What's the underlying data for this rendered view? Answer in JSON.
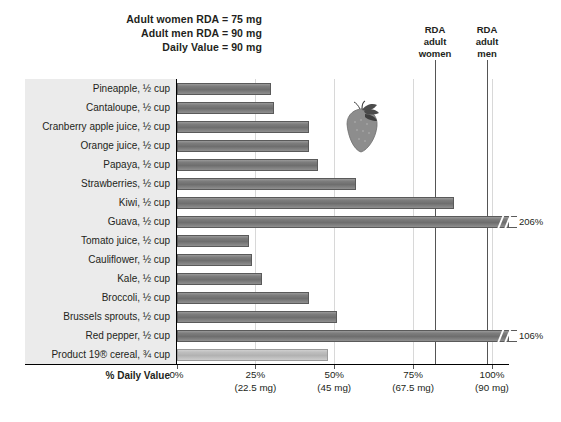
{
  "header": {
    "notes": [
      "Adult women RDA = 75 mg",
      "Adult men RDA = 90 mg",
      "Daily Value = 90 mg"
    ]
  },
  "annotations": {
    "women": [
      "RDA",
      "adult",
      "women"
    ],
    "men": [
      "RDA",
      "adult",
      "men"
    ]
  },
  "axis": {
    "title": "% Daily Value",
    "ticks": [
      {
        "pct": "0%",
        "mg": ""
      },
      {
        "pct": "25%",
        "mg": "(22.5 mg)"
      },
      {
        "pct": "50%",
        "mg": "(45 mg)"
      },
      {
        "pct": "75%",
        "mg": "(67.5 mg)"
      },
      {
        "pct": "100%",
        "mg": "(90 mg)"
      }
    ]
  },
  "illustration": {
    "name": "strawberry-illustration"
  },
  "chart_data": {
    "type": "bar",
    "xlabel": "% Daily Value",
    "ylabel": "",
    "xlim": [
      0,
      110
    ],
    "grid": true,
    "orientation": "horizontal",
    "legend": "none",
    "reference_lines": [
      {
        "label": "RDA adult women",
        "value": 83.3,
        "note": "75 mg"
      },
      {
        "label": "RDA adult men",
        "value": 100,
        "note": "90 mg"
      }
    ],
    "categories": [
      "Pineapple, ½ cup",
      "Cantaloupe, ½ cup",
      "Cranberry apple juice, ½ cup",
      "Orange juice, ½ cup",
      "Papaya, ½ cup",
      "Strawberries, ½ cup",
      "Kiwi, ½ cup",
      "Guava, ½ cup",
      "Tomato juice, ½ cup",
      "Cauliflower, ½ cup",
      "Kale, ½ cup",
      "Broccoli, ½ cup",
      "Brussels sprouts, ½ cup",
      "Red pepper, ½ cup",
      "Product 19® cereal, ¾ cup"
    ],
    "values": [
      30,
      31,
      42,
      42,
      45,
      57,
      88,
      206,
      23,
      24,
      27,
      42,
      51,
      106,
      48
    ],
    "value_labels": [
      "",
      "",
      "",
      "",
      "",
      "",
      "",
      "206%",
      "",
      "",
      "",
      "",
      "",
      "106%",
      ""
    ],
    "truncated": [
      false,
      false,
      false,
      false,
      false,
      false,
      false,
      true,
      false,
      false,
      false,
      false,
      false,
      true,
      false
    ],
    "highlight": [
      false,
      false,
      false,
      false,
      false,
      false,
      false,
      false,
      false,
      false,
      false,
      false,
      false,
      false,
      true
    ]
  },
  "colors": {
    "bar": "#7d7d7d",
    "bar_highlight": "#bfbfbf",
    "label_panel": "#ebebeb",
    "grid": "#d8d8d8",
    "axis": "#000000",
    "text": "#231f20"
  }
}
